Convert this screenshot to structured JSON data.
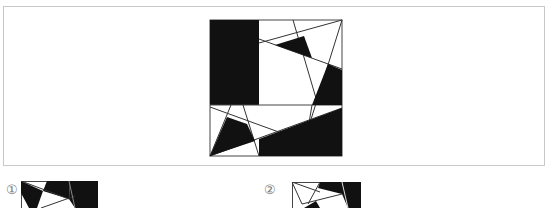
{
  "question": {
    "figure_name": "square-dissection-figure"
  },
  "options": [
    {
      "label": "①"
    },
    {
      "label": "②"
    }
  ],
  "colors": {
    "fill": "#111111",
    "line": "#222222",
    "frame": "#c8c8c8",
    "label": "#777777"
  }
}
